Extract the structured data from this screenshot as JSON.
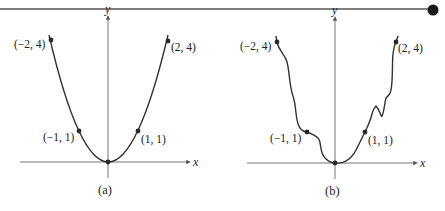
{
  "header_rule": {
    "color": "#555555",
    "dot_color": "#1a1a1a"
  },
  "panels": [
    {
      "id": "a",
      "caption": "(a)",
      "x_axis_label": "x",
      "y_axis_label": "y",
      "curve": "smooth parabola y = x^2",
      "points": [
        {
          "label": "(−2, 4)",
          "x": -2,
          "y": 4
        },
        {
          "label": "(−1, 1)",
          "x": -1,
          "y": 1
        },
        {
          "label": "(0, 0)",
          "x": 0,
          "y": 0
        },
        {
          "label": "(1, 1)",
          "x": 1,
          "y": 1
        },
        {
          "label": "(2, 4)",
          "x": 2,
          "y": 4
        }
      ]
    },
    {
      "id": "b",
      "caption": "(b)",
      "x_axis_label": "x",
      "y_axis_label": "y",
      "curve": "irregular wavy curve through same points",
      "points": [
        {
          "label": "(−2, 4)",
          "x": -2,
          "y": 4
        },
        {
          "label": "(−1, 1)",
          "x": -1,
          "y": 1
        },
        {
          "label": "(0, 0)",
          "x": 0,
          "y": 0
        },
        {
          "label": "(1, 1)",
          "x": 1,
          "y": 1
        },
        {
          "label": "(2, 4)",
          "x": 2,
          "y": 4
        }
      ]
    }
  ],
  "colors": {
    "axis": "#666666",
    "curve": "#333333",
    "point": "#2a2a2a"
  }
}
